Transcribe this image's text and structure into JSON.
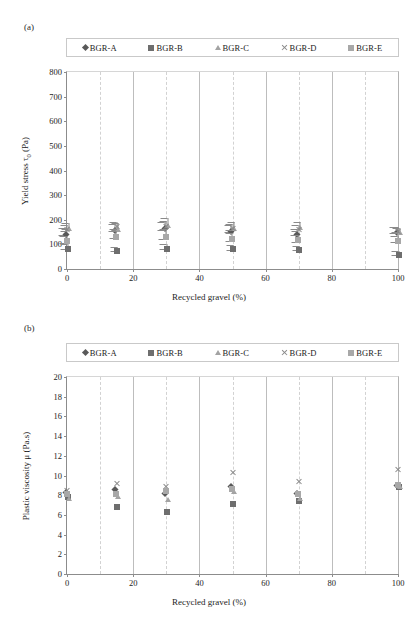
{
  "figure": {
    "panel_a_label": "(a)",
    "panel_b_label": "(b)",
    "series_names": [
      "BGR-A",
      "BGR-B",
      "BGR-C",
      "BGR-D",
      "BGR-E"
    ],
    "marker_icons": [
      "diamond-marker-icon",
      "square-dark-marker-icon",
      "triangle-marker-icon",
      "cross-x-marker-icon",
      "square-light-marker-icon"
    ],
    "colors": {
      "series_a": "#595959",
      "series_b": "#6e6e6e",
      "series_c": "#a3a3a3",
      "series_d": "#8a8a8a",
      "series_e": "#a8a8a8",
      "axis": "#8c8c8c",
      "gridline": "#d2d2d2",
      "background": "#ffffff"
    }
  },
  "chart_data": [
    {
      "type": "scatter",
      "panel": "(a)",
      "title": "",
      "xlabel": "Recycled gravel (%)",
      "ylabel": "Yield stress  τ0 (Pa)",
      "ylabel_parts": {
        "pre": "Yield stress  ",
        "symbol": "τ",
        "sub": "0",
        "post": " (Pa)"
      },
      "xlim": [
        0,
        100
      ],
      "ylim": [
        0,
        800
      ],
      "xticks": [
        0,
        20,
        40,
        60,
        80,
        100
      ],
      "yticks": [
        0,
        100,
        200,
        300,
        400,
        500,
        600,
        700,
        800
      ],
      "grid": "vertical-dashed-every-10",
      "legend_position": "top",
      "x": [
        0,
        15,
        30,
        50,
        70,
        100
      ],
      "series": [
        {
          "name": "BGR-A",
          "marker": "diamond",
          "values": [
            152,
            168,
            175,
            163,
            150,
            160
          ],
          "errors": [
            14,
            15,
            16,
            14,
            13,
            12
          ]
        },
        {
          "name": "BGR-B",
          "marker": "square-dark",
          "values": [
            90,
            82,
            90,
            88,
            85,
            65
          ],
          "errors": [
            10,
            9,
            10,
            9,
            9,
            8
          ]
        },
        {
          "name": "BGR-C",
          "marker": "triangle",
          "values": [
            175,
            172,
            185,
            175,
            178,
            158
          ],
          "errors": [
            12,
            13,
            22,
            15,
            14,
            10
          ]
        },
        {
          "name": "BGR-D",
          "marker": "cross-x",
          "values": [
            168,
            178,
            178,
            170,
            168,
            160
          ],
          "errors": [
            12,
            14,
            15,
            13,
            12,
            11
          ]
        },
        {
          "name": "BGR-E",
          "marker": "square-light",
          "values": [
            120,
            140,
            140,
            130,
            125,
            122
          ],
          "errors": [
            14,
            16,
            18,
            16,
            15,
            12
          ]
        }
      ]
    },
    {
      "type": "scatter",
      "panel": "(b)",
      "title": "",
      "xlabel": "Recycled gravel (%)",
      "ylabel": "Plastic viscosity  μ (Pa.s)",
      "xlim": [
        0,
        100
      ],
      "ylim": [
        0,
        20
      ],
      "xticks": [
        0,
        20,
        40,
        60,
        80,
        100
      ],
      "yticks": [
        0,
        2,
        4,
        6,
        8,
        10,
        12,
        14,
        16,
        18,
        20
      ],
      "grid": "vertical-dashed-every-10",
      "legend_position": "top",
      "x": [
        0,
        15,
        30,
        50,
        70,
        100
      ],
      "series": [
        {
          "name": "BGR-A",
          "marker": "diamond",
          "values": [
            8.5,
            8.8,
            8.4,
            9.1,
            8.4,
            9.2
          ]
        },
        {
          "name": "BGR-B",
          "marker": "square-dark",
          "values": [
            8.0,
            7.0,
            6.5,
            7.3,
            7.6,
            9.0
          ]
        },
        {
          "name": "BGR-C",
          "marker": "triangle",
          "values": [
            7.9,
            8.1,
            7.8,
            8.6,
            7.9,
            9.1
          ]
        },
        {
          "name": "BGR-D",
          "marker": "cross-x",
          "values": [
            8.6,
            9.3,
            9.0,
            10.5,
            9.5,
            10.8
          ]
        },
        {
          "name": "BGR-E",
          "marker": "square-light",
          "values": [
            8.3,
            8.3,
            8.6,
            8.8,
            8.3,
            9.2
          ]
        }
      ]
    }
  ]
}
